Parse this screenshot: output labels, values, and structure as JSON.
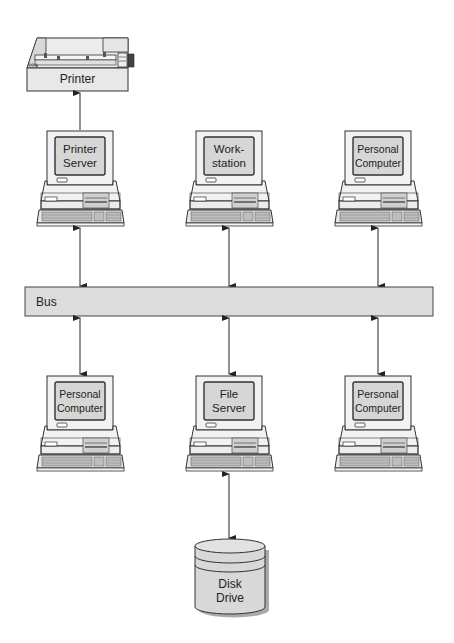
{
  "diagram": {
    "type": "bus network topology",
    "colors": {
      "fill": "#dcdcdc",
      "stroke": "#333333",
      "background": "#ffffff"
    },
    "printer": {
      "label": "Printer"
    },
    "bus": {
      "label": "Bus"
    },
    "top_row": [
      {
        "line1": "Printer",
        "line2": "Server",
        "role": "printer-server"
      },
      {
        "line1": "Work-",
        "line2": "station",
        "role": "workstation"
      },
      {
        "line1": "Personal",
        "line2": "Computer",
        "role": "personal-computer"
      }
    ],
    "bottom_row": [
      {
        "line1": "Personal",
        "line2": "Computer",
        "role": "personal-computer"
      },
      {
        "line1": "File",
        "line2": "Server",
        "role": "file-server"
      },
      {
        "line1": "Personal",
        "line2": "Computer",
        "role": "personal-computer"
      }
    ],
    "disk": {
      "line1": "Disk",
      "line2": "Drive"
    },
    "connections": [
      {
        "from": "Printer Server",
        "to": "Printer",
        "direction": "one-way"
      },
      {
        "from": "Printer Server",
        "to": "Bus",
        "direction": "two-way"
      },
      {
        "from": "Workstation",
        "to": "Bus",
        "direction": "two-way"
      },
      {
        "from": "Personal Computer (top)",
        "to": "Bus",
        "direction": "two-way"
      },
      {
        "from": "Bus",
        "to": "Personal Computer (bottom left)",
        "direction": "two-way"
      },
      {
        "from": "Bus",
        "to": "File Server",
        "direction": "two-way"
      },
      {
        "from": "Bus",
        "to": "Personal Computer (bottom right)",
        "direction": "two-way"
      },
      {
        "from": "File Server",
        "to": "Disk Drive",
        "direction": "two-way"
      }
    ]
  }
}
